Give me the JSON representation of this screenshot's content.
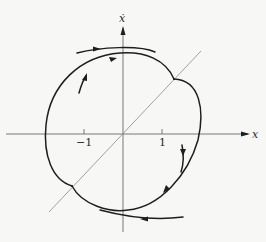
{
  "figure": {
    "type": "phase-plane-diagram",
    "axes": {
      "x_label": "x",
      "y_label": "ẋ",
      "tick_labels": [
        "−1",
        "1"
      ]
    },
    "elements": [
      "horizontal x-axis with arrow",
      "vertical ẋ-axis with arrow",
      "diagonal switching line through origin",
      "closed limit cycle with two cusps on switching line",
      "outer trajectory approaching from upper-left (arrow right)",
      "inner trajectory spiraling outward from left (arrows up/right)",
      "outer trajectory approaching from lower-right (arrow left)",
      "trajectory entering from right (arrows down)"
    ],
    "colors": {
      "background": "#f7f7f5",
      "curve": "#1e1e1e",
      "axis": "#6a6a6a",
      "switching_line": "#8a8a8a"
    }
  }
}
